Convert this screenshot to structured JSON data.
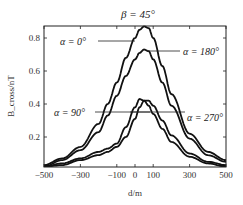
{
  "chart_data": {
    "type": "line",
    "title": "β = 45°",
    "xlabel": "d/m",
    "ylabel": "B_cross/nT",
    "xlim": [
      -500,
      500
    ],
    "ylim": [
      0.02,
      0.87
    ],
    "xticks": [
      -500,
      -300,
      -100,
      0,
      100,
      300,
      500
    ],
    "xtick_labels": [
      "−500",
      "−300",
      "−100",
      "0",
      "100",
      "300",
      "500"
    ],
    "yticks": [
      0.2,
      0.4,
      0.6,
      0.8
    ],
    "ytick_labels": [
      "0.2",
      "0.4",
      "0.6",
      "0.8"
    ],
    "grid": false,
    "legend": "inline annotations",
    "x": [
      -500,
      -400,
      -300,
      -200,
      -150,
      -100,
      -50,
      0,
      25,
      50,
      75,
      100,
      150,
      200,
      300,
      400,
      500
    ],
    "series": [
      {
        "name": "α = 0°",
        "values": [
          0.03,
          0.07,
          0.14,
          0.28,
          0.4,
          0.53,
          0.68,
          0.8,
          0.85,
          0.87,
          0.86,
          0.8,
          0.63,
          0.46,
          0.22,
          0.11,
          0.06
        ]
      },
      {
        "name": "α = 180°",
        "values": [
          0.02,
          0.06,
          0.12,
          0.23,
          0.33,
          0.45,
          0.57,
          0.67,
          0.71,
          0.73,
          0.72,
          0.67,
          0.53,
          0.39,
          0.19,
          0.09,
          0.05
        ]
      },
      {
        "name": "α = 90°",
        "values": [
          0.02,
          0.04,
          0.07,
          0.11,
          0.13,
          0.16,
          0.26,
          0.38,
          0.43,
          0.42,
          0.39,
          0.34,
          0.25,
          0.17,
          0.08,
          0.04,
          0.02
        ]
      },
      {
        "name": "α = 270°",
        "values": [
          0.02,
          0.03,
          0.06,
          0.09,
          0.11,
          0.14,
          0.2,
          0.31,
          0.38,
          0.42,
          0.42,
          0.39,
          0.3,
          0.21,
          0.1,
          0.05,
          0.03
        ]
      }
    ],
    "annotations": [
      {
        "text": "α = 0°",
        "series": "α = 0°"
      },
      {
        "text": "α = 180°",
        "series": "α = 180°"
      },
      {
        "text": "α = 90°",
        "series": "α = 90°"
      },
      {
        "text": "α = 270°",
        "series": "α = 270°"
      }
    ]
  }
}
